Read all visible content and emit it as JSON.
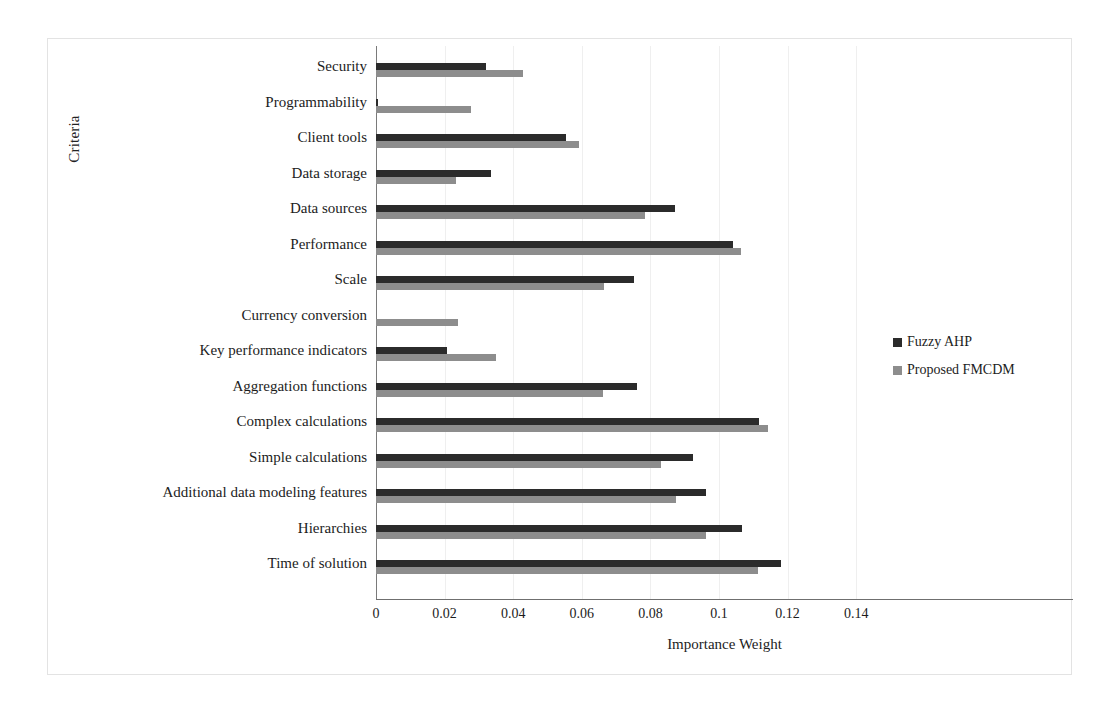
{
  "chart_data": {
    "type": "bar",
    "orientation": "horizontal",
    "title": "",
    "xlabel": "Importance Weight",
    "ylabel": "Criteria",
    "xlim": [
      0,
      0.15
    ],
    "xticks": [
      "0",
      "0.02",
      "0.04",
      "0.06",
      "0.08",
      "0.1",
      "0.12",
      "0.14"
    ],
    "xtick_values": [
      0,
      0.02,
      0.04,
      0.06,
      0.08,
      0.1,
      0.12,
      0.14
    ],
    "grid": true,
    "legend_position": "right",
    "categories": [
      "Security",
      "Programmability",
      "Client tools",
      "Data storage",
      "Data sources",
      "Performance",
      "Scale",
      "Currency conversion",
      "Key performance indicators",
      "Aggregation functions",
      "Complex calculations",
      "Simple calculations",
      "Additional data modeling features",
      "Hierarchies",
      "Time of solution"
    ],
    "series": [
      {
        "name": "Fuzzy AHP",
        "color": "#2b2b2b",
        "values": [
          0.032,
          0.0005,
          0.0554,
          0.0335,
          0.0872,
          0.104,
          0.0752,
          0.0,
          0.0207,
          0.0761,
          0.1117,
          0.0924,
          0.0962,
          0.1067,
          0.118
        ]
      },
      {
        "name": "Proposed FMCDM",
        "color": "#8d8d8d",
        "values": [
          0.0428,
          0.0277,
          0.0592,
          0.0233,
          0.0784,
          0.1064,
          0.0665,
          0.0239,
          0.035,
          0.0662,
          0.1143,
          0.0831,
          0.0875,
          0.0962,
          0.1113
        ]
      }
    ]
  },
  "legend": {
    "items": [
      {
        "label": "Fuzzy AHP",
        "swatch": "dark"
      },
      {
        "label": "Proposed FMCDM",
        "swatch": "light"
      }
    ]
  }
}
